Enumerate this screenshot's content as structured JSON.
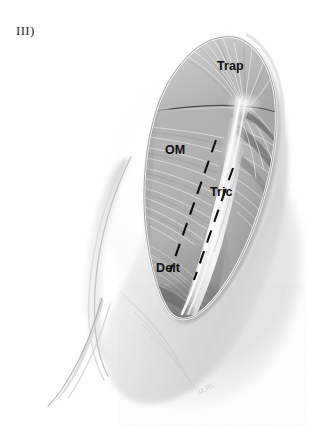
{
  "figure": {
    "number_label": "III)",
    "signature": "a.m.",
    "background_color": "#ffffff",
    "ink_color": "#101010"
  },
  "anatomy_labels": [
    {
      "id": "trap",
      "text": "Trap",
      "full_name": "Trapezius",
      "x": 217,
      "y": 59
    },
    {
      "id": "om",
      "text": "OM",
      "full_name": "Omohyoid / Medial border",
      "x": 165,
      "y": 143
    },
    {
      "id": "tric",
      "text": "Tric",
      "full_name": "Triceps",
      "x": 210,
      "y": 185
    },
    {
      "id": "delt",
      "text": "Delt",
      "full_name": "Deltoid",
      "x": 156,
      "y": 261
    }
  ],
  "incision_markers": {
    "style": "dashed",
    "color": "#0d0d0d",
    "count": 2,
    "description": "Two parallel dashed planned-incision lines"
  },
  "render": {
    "width": 332,
    "height": 447,
    "medium": "grayscale pencil / airbrush medical illustration"
  }
}
